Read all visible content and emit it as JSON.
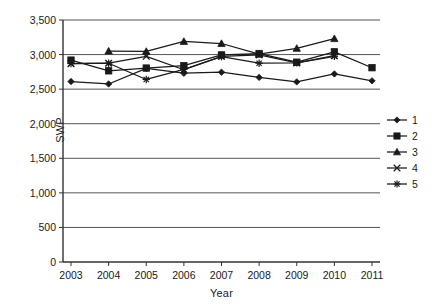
{
  "chart_data": {
    "type": "line",
    "title": "",
    "xlabel": "Year",
    "ylabel": "SWP",
    "x": [
      2003,
      2004,
      2005,
      2006,
      2007,
      2008,
      2009,
      2010,
      2011
    ],
    "categories": [
      "2003",
      "2004",
      "2005",
      "2006",
      "2007",
      "2008",
      "2009",
      "2010",
      "2011"
    ],
    "ylim": [
      0,
      3500
    ],
    "yticks": [
      0,
      500,
      1000,
      1500,
      2000,
      2500,
      3000,
      3500
    ],
    "ytick_labels": [
      "0",
      "500",
      "1,000",
      "1,500",
      "2,000",
      "2,500",
      "3,000",
      "3,500"
    ],
    "grid": "horizontal",
    "legend_position": "right",
    "series": [
      {
        "name": "1",
        "marker": "diamond",
        "x": [
          2003,
          2004,
          2005,
          2006,
          2007,
          2008,
          2009,
          2010,
          2011
        ],
        "values": [
          2610,
          2575,
          2800,
          2730,
          2745,
          2670,
          2605,
          2720,
          2620
        ]
      },
      {
        "name": "2",
        "marker": "square",
        "x": [
          2003,
          2004,
          2005,
          2006,
          2007,
          2008,
          2009,
          2010,
          2011
        ],
        "values": [
          2920,
          2765,
          2805,
          2840,
          2995,
          3015,
          2890,
          3040,
          2810
        ]
      },
      {
        "name": "3",
        "marker": "triangle",
        "x": [
          2004,
          2005,
          2006,
          2007,
          2008,
          2009,
          2010
        ],
        "values": [
          3050,
          3045,
          3190,
          3160,
          3005,
          3090,
          3230
        ]
      },
      {
        "name": "4",
        "marker": "cross",
        "x": [
          2003,
          2004,
          2005,
          2006,
          2007,
          2008,
          2009,
          2010
        ],
        "values": [
          2870,
          2875,
          2975,
          2780,
          2975,
          2995,
          2880,
          2985
        ]
      },
      {
        "name": "5",
        "marker": "asterisk",
        "x": [
          2003,
          2004,
          2005,
          2006,
          2007,
          2008,
          2009,
          2010
        ],
        "values": [
          2870,
          2875,
          2640,
          2785,
          2970,
          2875,
          2880,
          2975
        ]
      }
    ],
    "legend": [
      {
        "label": "1",
        "marker": "diamond"
      },
      {
        "label": "2",
        "marker": "square"
      },
      {
        "label": "3",
        "marker": "triangle"
      },
      {
        "label": "4",
        "marker": "cross"
      },
      {
        "label": "5",
        "marker": "asterisk"
      }
    ],
    "colors": {
      "series": "#1a1a1a",
      "grid": "#555555",
      "axis": "#333333",
      "background": "#ffffff"
    }
  }
}
